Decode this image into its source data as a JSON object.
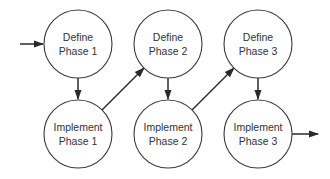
{
  "diagram": {
    "type": "process-flow",
    "colors": {
      "stroke": "#3a3a3a",
      "text": "#333333",
      "arrow": "#2a2a2a",
      "background": "#ffffff"
    },
    "nodes": [
      {
        "id": "define-1",
        "line1": "Define",
        "line2": "Phase 1",
        "cx": 78,
        "cy": 44
      },
      {
        "id": "define-2",
        "line1": "Define",
        "line2": "Phase 2",
        "cx": 168,
        "cy": 44
      },
      {
        "id": "define-3",
        "line1": "Define",
        "line2": "Phase 3",
        "cx": 258,
        "cy": 44
      },
      {
        "id": "implement-1",
        "line1": "Implement",
        "line2": "Phase 1",
        "cx": 78,
        "cy": 134
      },
      {
        "id": "implement-2",
        "line1": "Implement",
        "line2": "Phase 2",
        "cx": 168,
        "cy": 134
      },
      {
        "id": "implement-3",
        "line1": "Implement",
        "line2": "Phase 3",
        "cx": 258,
        "cy": 134
      }
    ],
    "node_radius": 34,
    "edges": [
      {
        "from": "start",
        "to": "define-1"
      },
      {
        "from": "define-1",
        "to": "implement-1"
      },
      {
        "from": "implement-1",
        "to": "define-2"
      },
      {
        "from": "define-2",
        "to": "implement-2"
      },
      {
        "from": "implement-2",
        "to": "define-3"
      },
      {
        "from": "define-3",
        "to": "implement-3"
      },
      {
        "from": "implement-3",
        "to": "end"
      }
    ]
  }
}
